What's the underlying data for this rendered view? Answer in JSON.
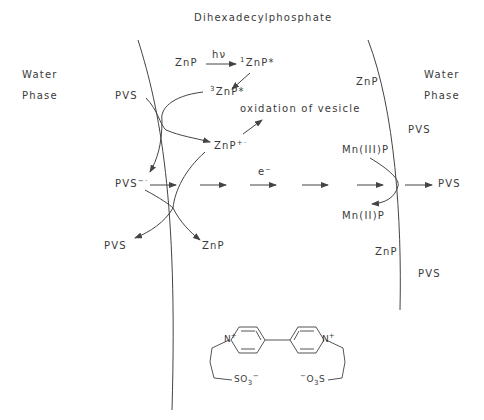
{
  "title": "Dihexadecylphosphate",
  "phases": {
    "left": [
      "Water",
      "Phase"
    ],
    "right": [
      "Water",
      "Phase"
    ]
  },
  "species": {
    "znp_top": "ZnP",
    "hv": "hν",
    "singlet_prefix": "1",
    "singlet": "ZnP*",
    "triplet_prefix": "3",
    "triplet": "ZnP*",
    "oxidation": "oxidation of vesicle",
    "pvs_left_top": "PVS",
    "znp_cation": "ZnP",
    "znp_cation_charge": "+·",
    "pvs_radical": "PVS",
    "pvs_radical_charge": "−·",
    "electron": "e⁻",
    "pvs_bottom_left": "PVS",
    "znp_bottom": "ZnP",
    "znp_right_top": "ZnP",
    "pvs_right_top": "PVS",
    "mn3": "Mn(III)P",
    "mn2": "Mn(II)P",
    "pvs_right_out": "PVS",
    "znp_right_bottom": "ZnP",
    "pvs_right_bottom": "PVS"
  },
  "structure": {
    "n_plus_left": "N",
    "n_plus_right": "N",
    "plus": "+",
    "so3_left": "SO",
    "so3_left_sub": "3",
    "so3_left_charge": "−",
    "o3s_right_charge": "−",
    "o3s_right": "O",
    "o3s_right_sub": "3",
    "o3s_right_s": "S"
  }
}
